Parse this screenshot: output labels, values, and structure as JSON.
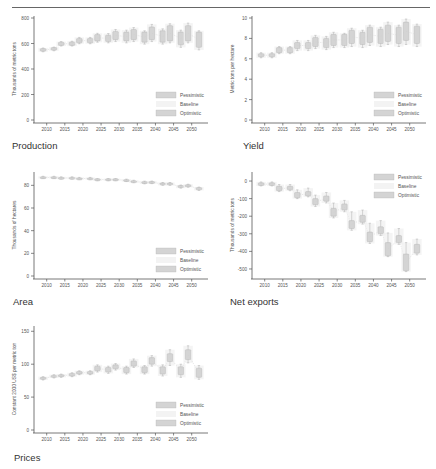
{
  "header": {
    "title": ""
  },
  "legend": [
    "Pessimistic",
    "Baseline",
    "Optimistic"
  ],
  "colors": {
    "box": "#d4d4d4",
    "box_stroke": "#b0b0b0",
    "baseline": "#ececec",
    "axis": "#555555",
    "text": "#555555"
  },
  "chart_data": [
    {
      "id": "production",
      "type": "box",
      "title": "Production",
      "ylabel": "Thousands of metric tons",
      "ylim": [
        0,
        800
      ],
      "yticks": [
        0,
        200,
        400,
        600,
        800
      ],
      "categories": [
        "2010",
        "2015",
        "2020",
        "2025",
        "2030",
        "2035",
        "2040",
        "2045",
        "2050"
      ],
      "legend_position": "lower right",
      "boxes": [
        {
          "x": 2009,
          "lo": 540,
          "hi": 560,
          "wlo": 535,
          "whi": 565
        },
        {
          "x": 2012,
          "lo": 548,
          "hi": 568,
          "wlo": 543,
          "whi": 572
        },
        {
          "x": 2014,
          "lo": 585,
          "hi": 610,
          "wlo": 580,
          "whi": 615
        },
        {
          "x": 2017,
          "lo": 585,
          "hi": 612,
          "wlo": 580,
          "whi": 618
        },
        {
          "x": 2019,
          "lo": 605,
          "hi": 640,
          "wlo": 598,
          "whi": 648
        },
        {
          "x": 2022,
          "lo": 605,
          "hi": 640,
          "wlo": 598,
          "whi": 648
        },
        {
          "x": 2024,
          "lo": 620,
          "hi": 670,
          "wlo": 610,
          "whi": 680
        },
        {
          "x": 2027,
          "lo": 615,
          "hi": 665,
          "wlo": 605,
          "whi": 678
        },
        {
          "x": 2029,
          "lo": 630,
          "hi": 695,
          "wlo": 615,
          "whi": 710
        },
        {
          "x": 2032,
          "lo": 620,
          "hi": 690,
          "wlo": 605,
          "whi": 705
        },
        {
          "x": 2034,
          "lo": 630,
          "hi": 710,
          "wlo": 615,
          "whi": 725
        },
        {
          "x": 2037,
          "lo": 610,
          "hi": 690,
          "wlo": 595,
          "whi": 700
        },
        {
          "x": 2039,
          "lo": 630,
          "hi": 730,
          "wlo": 615,
          "whi": 750
        },
        {
          "x": 2042,
          "lo": 610,
          "hi": 700,
          "wlo": 595,
          "whi": 715
        },
        {
          "x": 2044,
          "lo": 620,
          "hi": 740,
          "wlo": 605,
          "whi": 755
        },
        {
          "x": 2047,
          "lo": 590,
          "hi": 690,
          "wlo": 570,
          "whi": 705
        },
        {
          "x": 2049,
          "lo": 620,
          "hi": 740,
          "wlo": 605,
          "whi": 760
        },
        {
          "x": 2052,
          "lo": 570,
          "hi": 690,
          "wlo": 550,
          "whi": 700
        }
      ]
    },
    {
      "id": "yield",
      "type": "box",
      "title": "Yield",
      "ylabel": "Metric tons per hectare",
      "ylim": [
        0,
        10
      ],
      "yticks": [
        0,
        2,
        4,
        6,
        8,
        10
      ],
      "categories": [
        "2010",
        "2015",
        "2020",
        "2025",
        "2030",
        "2035",
        "2040",
        "2045",
        "2050"
      ],
      "legend_position": "lower right",
      "boxes": [
        {
          "x": 2009,
          "lo": 6.2,
          "hi": 6.5,
          "wlo": 6.1,
          "whi": 6.6
        },
        {
          "x": 2012,
          "lo": 6.2,
          "hi": 6.5,
          "wlo": 6.1,
          "whi": 6.6
        },
        {
          "x": 2014,
          "lo": 6.6,
          "hi": 7.1,
          "wlo": 6.5,
          "whi": 7.2
        },
        {
          "x": 2017,
          "lo": 6.6,
          "hi": 7.1,
          "wlo": 6.5,
          "whi": 7.2
        },
        {
          "x": 2019,
          "lo": 7.0,
          "hi": 7.6,
          "wlo": 6.8,
          "whi": 7.8
        },
        {
          "x": 2022,
          "lo": 7.0,
          "hi": 7.6,
          "wlo": 6.8,
          "whi": 7.8
        },
        {
          "x": 2024,
          "lo": 7.2,
          "hi": 8.1,
          "wlo": 7.0,
          "whi": 8.3
        },
        {
          "x": 2027,
          "lo": 7.1,
          "hi": 8.0,
          "wlo": 6.9,
          "whi": 8.2
        },
        {
          "x": 2029,
          "lo": 7.3,
          "hi": 8.4,
          "wlo": 7.1,
          "whi": 8.6
        },
        {
          "x": 2032,
          "lo": 7.3,
          "hi": 8.4,
          "wlo": 7.1,
          "whi": 8.5
        },
        {
          "x": 2034,
          "lo": 7.5,
          "hi": 8.8,
          "wlo": 7.2,
          "whi": 9.0
        },
        {
          "x": 2037,
          "lo": 7.4,
          "hi": 8.6,
          "wlo": 7.1,
          "whi": 8.8
        },
        {
          "x": 2039,
          "lo": 7.6,
          "hi": 9.1,
          "wlo": 7.3,
          "whi": 9.3
        },
        {
          "x": 2042,
          "lo": 7.5,
          "hi": 8.9,
          "wlo": 7.2,
          "whi": 9.1
        },
        {
          "x": 2044,
          "lo": 7.7,
          "hi": 9.3,
          "wlo": 7.4,
          "whi": 9.6
        },
        {
          "x": 2047,
          "lo": 7.5,
          "hi": 9.1,
          "wlo": 7.2,
          "whi": 9.3
        },
        {
          "x": 2049,
          "lo": 7.8,
          "hi": 9.6,
          "wlo": 7.4,
          "whi": 9.9
        },
        {
          "x": 2052,
          "lo": 7.5,
          "hi": 9.2,
          "wlo": 7.2,
          "whi": 9.4
        }
      ]
    },
    {
      "id": "area",
      "type": "box",
      "title": "Area",
      "ylabel": "Thousands of hectares",
      "ylim": [
        0,
        90
      ],
      "yticks": [
        0,
        20,
        40,
        60,
        80
      ],
      "categories": [
        "2010",
        "2015",
        "2020",
        "2025",
        "2030",
        "2035",
        "2040",
        "2045",
        "2050"
      ],
      "legend_position": "lower right",
      "boxes": [
        {
          "x": 2009,
          "lo": 86.5,
          "hi": 87.5,
          "wlo": 86,
          "whi": 88
        },
        {
          "x": 2012,
          "lo": 86.5,
          "hi": 87.5,
          "wlo": 86,
          "whi": 88
        },
        {
          "x": 2014,
          "lo": 86,
          "hi": 87,
          "wlo": 85.5,
          "whi": 87.5
        },
        {
          "x": 2017,
          "lo": 86,
          "hi": 87,
          "wlo": 85.5,
          "whi": 87.5
        },
        {
          "x": 2019,
          "lo": 85.5,
          "hi": 86.5,
          "wlo": 85,
          "whi": 87
        },
        {
          "x": 2022,
          "lo": 85.5,
          "hi": 86.5,
          "wlo": 85,
          "whi": 87
        },
        {
          "x": 2024,
          "lo": 84.5,
          "hi": 85.7,
          "wlo": 84,
          "whi": 86
        },
        {
          "x": 2027,
          "lo": 84.5,
          "hi": 85.7,
          "wlo": 84,
          "whi": 86
        },
        {
          "x": 2029,
          "lo": 84.5,
          "hi": 85.7,
          "wlo": 84,
          "whi": 86
        },
        {
          "x": 2032,
          "lo": 83.8,
          "hi": 85,
          "wlo": 83.3,
          "whi": 85.5
        },
        {
          "x": 2034,
          "lo": 82.8,
          "hi": 84,
          "wlo": 82.3,
          "whi": 84.5
        },
        {
          "x": 2037,
          "lo": 81.8,
          "hi": 83.2,
          "wlo": 81.3,
          "whi": 83.7
        },
        {
          "x": 2039,
          "lo": 82,
          "hi": 83.3,
          "wlo": 81.5,
          "whi": 83.8
        },
        {
          "x": 2042,
          "lo": 80.5,
          "hi": 82,
          "wlo": 80,
          "whi": 82.5
        },
        {
          "x": 2044,
          "lo": 80.5,
          "hi": 82,
          "wlo": 80,
          "whi": 82.5
        },
        {
          "x": 2047,
          "lo": 78,
          "hi": 79.8,
          "wlo": 77.5,
          "whi": 80.3
        },
        {
          "x": 2049,
          "lo": 78.8,
          "hi": 80.5,
          "wlo": 78.3,
          "whi": 81
        },
        {
          "x": 2052,
          "lo": 76,
          "hi": 78,
          "wlo": 75.5,
          "whi": 78.5
        }
      ]
    },
    {
      "id": "net-exports",
      "type": "box",
      "title": "Net exports",
      "ylabel": "Thousands of metric tons",
      "ylim": [
        -540,
        40
      ],
      "yticks": [
        0,
        -100,
        -200,
        -300,
        -400,
        -500
      ],
      "categories": [
        "2010",
        "2015",
        "2020",
        "2025",
        "2030",
        "2035",
        "2040",
        "2045",
        "2050"
      ],
      "legend_position": "upper right",
      "boxes": [
        {
          "x": 2009,
          "lo": -25,
          "hi": -10,
          "wlo": -28,
          "whi": -5
        },
        {
          "x": 2012,
          "lo": -25,
          "hi": -10,
          "wlo": -28,
          "whi": -5
        },
        {
          "x": 2014,
          "lo": -55,
          "hi": -30,
          "wlo": -60,
          "whi": -20
        },
        {
          "x": 2017,
          "lo": -50,
          "hi": -30,
          "wlo": -55,
          "whi": -20
        },
        {
          "x": 2019,
          "lo": -95,
          "hi": -65,
          "wlo": -100,
          "whi": -50
        },
        {
          "x": 2022,
          "lo": -85,
          "hi": -60,
          "wlo": -90,
          "whi": -40
        },
        {
          "x": 2024,
          "lo": -135,
          "hi": -100,
          "wlo": -145,
          "whi": -80
        },
        {
          "x": 2027,
          "lo": -115,
          "hi": -85,
          "wlo": -125,
          "whi": -65
        },
        {
          "x": 2029,
          "lo": -200,
          "hi": -155,
          "wlo": -210,
          "whi": -125
        },
        {
          "x": 2032,
          "lo": -165,
          "hi": -130,
          "wlo": -175,
          "whi": -110
        },
        {
          "x": 2034,
          "lo": -270,
          "hi": -225,
          "wlo": -280,
          "whi": -175
        },
        {
          "x": 2037,
          "lo": -235,
          "hi": -195,
          "wlo": -245,
          "whi": -165
        },
        {
          "x": 2039,
          "lo": -345,
          "hi": -290,
          "wlo": -355,
          "whi": -240
        },
        {
          "x": 2042,
          "lo": -300,
          "hi": -260,
          "wlo": -310,
          "whi": -225
        },
        {
          "x": 2044,
          "lo": -425,
          "hi": -350,
          "wlo": -430,
          "whi": -295
        },
        {
          "x": 2047,
          "lo": -350,
          "hi": -310,
          "wlo": -360,
          "whi": -270
        },
        {
          "x": 2049,
          "lo": -510,
          "hi": -415,
          "wlo": -515,
          "whi": -350
        },
        {
          "x": 2052,
          "lo": -410,
          "hi": -360,
          "wlo": -420,
          "whi": -330
        }
      ]
    },
    {
      "id": "prices",
      "type": "box",
      "title": "Prices",
      "ylabel": "Constant 2000 US$ per metric ton",
      "ylim": [
        0,
        155
      ],
      "yticks": [
        0,
        50,
        100,
        150
      ],
      "categories": [
        "2010",
        "2015",
        "2020",
        "2025",
        "2030",
        "2035",
        "2040",
        "2045",
        "2050"
      ],
      "legend_position": "lower right",
      "boxes": [
        {
          "x": 2009,
          "lo": 77,
          "hi": 80,
          "wlo": 76,
          "whi": 81
        },
        {
          "x": 2012,
          "lo": 80,
          "hi": 83,
          "wlo": 79,
          "whi": 84
        },
        {
          "x": 2014,
          "lo": 81,
          "hi": 84,
          "wlo": 80,
          "whi": 85
        },
        {
          "x": 2017,
          "lo": 82,
          "hi": 86,
          "wlo": 81,
          "whi": 87
        },
        {
          "x": 2019,
          "lo": 85,
          "hi": 89,
          "wlo": 84,
          "whi": 90
        },
        {
          "x": 2022,
          "lo": 85,
          "hi": 89,
          "wlo": 84,
          "whi": 90
        },
        {
          "x": 2024,
          "lo": 90,
          "hi": 97,
          "wlo": 88,
          "whi": 99
        },
        {
          "x": 2027,
          "lo": 88,
          "hi": 95,
          "wlo": 86,
          "whi": 97
        },
        {
          "x": 2029,
          "lo": 93,
          "hi": 99,
          "wlo": 91,
          "whi": 101
        },
        {
          "x": 2032,
          "lo": 87,
          "hi": 95,
          "wlo": 85,
          "whi": 97
        },
        {
          "x": 2034,
          "lo": 97,
          "hi": 105,
          "wlo": 95,
          "whi": 108
        },
        {
          "x": 2037,
          "lo": 87,
          "hi": 96,
          "wlo": 85,
          "whi": 98
        },
        {
          "x": 2039,
          "lo": 100,
          "hi": 110,
          "wlo": 97,
          "whi": 113
        },
        {
          "x": 2042,
          "lo": 85,
          "hi": 96,
          "wlo": 82,
          "whi": 99
        },
        {
          "x": 2044,
          "lo": 104,
          "hi": 116,
          "wlo": 98,
          "whi": 122
        },
        {
          "x": 2047,
          "lo": 84,
          "hi": 96,
          "wlo": 80,
          "whi": 100
        },
        {
          "x": 2049,
          "lo": 107,
          "hi": 122,
          "wlo": 102,
          "whi": 128
        },
        {
          "x": 2052,
          "lo": 80,
          "hi": 94,
          "wlo": 77,
          "whi": 98
        }
      ]
    }
  ],
  "captions": {
    "production": "Production",
    "yield": "Yield",
    "area": "Area",
    "net_exports": "Net exports",
    "prices": "Prices"
  }
}
